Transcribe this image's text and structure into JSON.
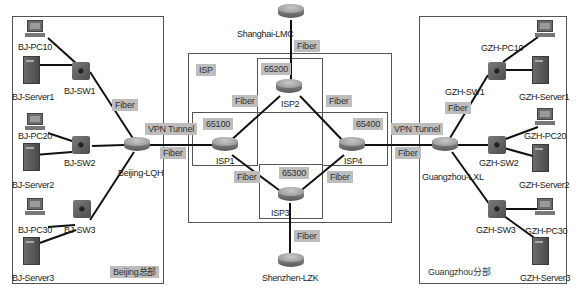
{
  "diagram": {
    "type": "network-topology",
    "link_color": "#111111",
    "tag_bg": "#bdbdbd",
    "regions": {
      "beijing": {
        "label": "Beijing总部"
      },
      "guangzhou": {
        "label": "Guangzhou分部"
      },
      "isp": {
        "label": "ISP"
      },
      "as65100": {
        "label": "65100"
      },
      "as65200": {
        "label": "65200"
      },
      "as65300": {
        "label": "65300"
      },
      "as65400": {
        "label": "65400"
      }
    },
    "routers": {
      "shanghai": "Shanghai-LMC",
      "shenzhen": "Shenzhen-LZK",
      "isp1": "ISP1",
      "isp2": "ISP2",
      "isp3": "ISP3",
      "isp4": "ISP4",
      "beijing": "Beijing-LQH",
      "guangzhou": "Guangzhou-LXL"
    },
    "beijing_devices": {
      "pc10": "BJ-PC10",
      "server1": "BJ-Server1",
      "sw1": "BJ-SW1",
      "pc20": "BJ-PC20",
      "server2": "BJ-Server2",
      "sw2": "BJ-SW2",
      "pc30": "BJ-PC30",
      "server3": "BJ-Server3",
      "sw3": "BJ-SW3"
    },
    "guangzhou_devices": {
      "pc10": "GZH-PC10",
      "server1": "GZH-Server1",
      "sw1": "GZH-SW1",
      "pc20": "GZH-PC20",
      "server2": "GZH-Server2",
      "sw2": "GZH-SW2",
      "pc30": "GZH-PC30",
      "server3": "GZH-Server3",
      "sw3": "GZH-SW3"
    },
    "link_labels": {
      "fiber": "Fiber",
      "vpn": "VPN Tunnel"
    }
  }
}
